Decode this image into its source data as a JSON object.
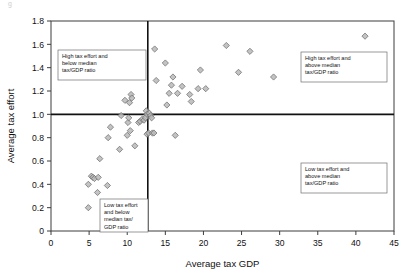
{
  "figure": {
    "top_fragment": "g",
    "marker_color": "#b9b9b9",
    "marker_edge_color": "#6d6d6d",
    "frame_color": "#3d3d3d",
    "median_line_color": "#111111"
  },
  "annotations": [
    {
      "name": "quadrant-label-top-left",
      "lines": [
        "High tax effort and",
        "below median",
        "tax/GDP ratio"
      ],
      "x": 58,
      "y": 50,
      "w": 88,
      "h": 30
    },
    {
      "name": "quadrant-label-top-right",
      "lines": [
        "High tax effort and",
        "above median",
        "tax/GDP ratio"
      ],
      "x": 301,
      "y": 52,
      "w": 86,
      "h": 30
    },
    {
      "name": "quadrant-label-bottom-right",
      "lines": [
        "Low tax effort and",
        "above median",
        "tax/GDP ratio"
      ],
      "x": 301,
      "y": 163,
      "w": 86,
      "h": 30
    },
    {
      "name": "quadrant-label-bottom-left",
      "lines": [
        "Low tax effort",
        "and below",
        "median tax/",
        "GDP ratio"
      ],
      "x": 100,
      "y": 199,
      "w": 48,
      "h": 33
    }
  ],
  "chart_data": {
    "type": "scatter",
    "title": "",
    "xlabel": "Average tax GDP",
    "ylabel": "Average tax effort",
    "xlim": [
      0,
      45
    ],
    "ylim": [
      0,
      1.8
    ],
    "xticks": [
      0,
      5,
      10,
      15,
      20,
      25,
      30,
      35,
      40,
      45
    ],
    "yticks": [
      0,
      0.2,
      0.4,
      0.6,
      0.8,
      1.0,
      1.2,
      1.4,
      1.6,
      1.8
    ],
    "xtick_labels": [
      "0",
      "5",
      "10",
      "15",
      "20",
      "25",
      "30",
      "35",
      "40",
      "45"
    ],
    "ytick_labels": [
      "0",
      "0.2",
      "0.4",
      "0.6",
      "0.8",
      "1.0",
      "1.2",
      "1.4",
      "1.6",
      "1.8"
    ],
    "grid": false,
    "legend": null,
    "reference_lines": [
      {
        "name": "median-tax-effort",
        "orientation": "horizontal",
        "value": 1.0
      },
      {
        "name": "median-tax-gdp",
        "orientation": "vertical",
        "value": 12.7
      }
    ],
    "points": [
      [
        4.9,
        0.2
      ],
      [
        4.9,
        0.4
      ],
      [
        5.3,
        0.47
      ],
      [
        5.5,
        0.46
      ],
      [
        5.7,
        0.45
      ],
      [
        6.1,
        0.33
      ],
      [
        6.2,
        0.46
      ],
      [
        6.4,
        0.62
      ],
      [
        7.4,
        0.39
      ],
      [
        7.5,
        0.8
      ],
      [
        7.8,
        0.89
      ],
      [
        9.0,
        0.7
      ],
      [
        9.2,
        0.99
      ],
      [
        9.7,
        1.12
      ],
      [
        10.0,
        0.82
      ],
      [
        10.1,
        0.93
      ],
      [
        10.2,
        0.97
      ],
      [
        10.3,
        1.1
      ],
      [
        10.4,
        0.86
      ],
      [
        10.5,
        1.17
      ],
      [
        10.6,
        1.14
      ],
      [
        11.0,
        0.73
      ],
      [
        11.2,
        1.45
      ],
      [
        11.5,
        0.93
      ],
      [
        11.7,
        0.94
      ],
      [
        12.0,
        0.96
      ],
      [
        12.2,
        0.95
      ],
      [
        12.4,
        0.97
      ],
      [
        12.5,
        1.03
      ],
      [
        12.6,
        1.0
      ],
      [
        12.6,
        0.83
      ],
      [
        12.8,
        0.84
      ],
      [
        12.9,
        1.01
      ],
      [
        13.1,
        0.99
      ],
      [
        13.2,
        0.97
      ],
      [
        13.3,
        0.84
      ],
      [
        13.5,
        0.84
      ],
      [
        13.6,
        1.56
      ],
      [
        13.8,
        1.29
      ],
      [
        15.0,
        1.44
      ],
      [
        15.2,
        1.08
      ],
      [
        15.5,
        1.18
      ],
      [
        15.8,
        1.25
      ],
      [
        16.0,
        1.32
      ],
      [
        16.3,
        0.82
      ],
      [
        16.6,
        1.18
      ],
      [
        17.2,
        1.24
      ],
      [
        18.2,
        1.17
      ],
      [
        18.4,
        1.11
      ],
      [
        19.3,
        1.22
      ],
      [
        19.6,
        1.38
      ],
      [
        20.3,
        1.22
      ],
      [
        23.0,
        1.59
      ],
      [
        24.6,
        1.36
      ],
      [
        26.1,
        1.54
      ],
      [
        29.2,
        1.32
      ],
      [
        41.2,
        1.67
      ]
    ]
  }
}
